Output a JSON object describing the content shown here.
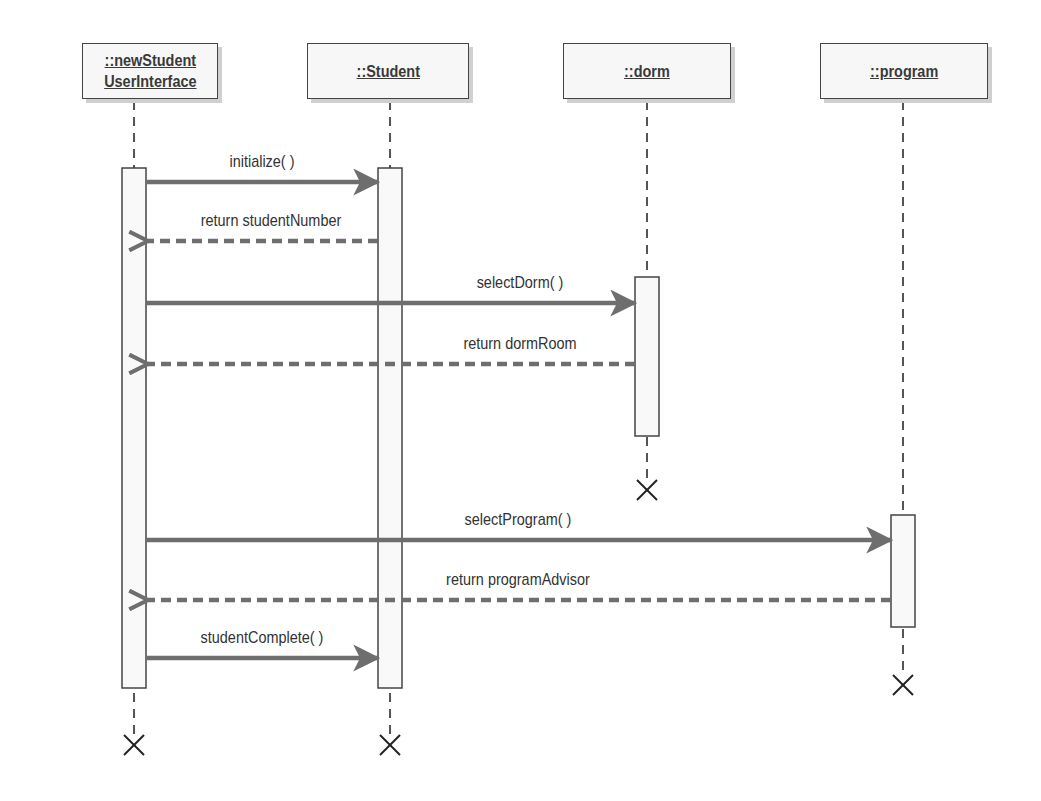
{
  "diagram_type": "UML sequence diagram",
  "colors": {
    "box_fill": "#f7f7f7",
    "box_border": "#444444",
    "box_shadow": "#d0d0d0",
    "lifeline": "#555555",
    "message_arrow": "#6e6e6e",
    "activation_fill": "#f9f9f9"
  },
  "objects": [
    {
      "id": "ui",
      "label": "::newStudent\nUserInterface",
      "x": 134,
      "box": [
        82,
        43,
        136,
        56
      ]
    },
    {
      "id": "student",
      "label": "::Student",
      "x": 390,
      "box": [
        307,
        43,
        162,
        56
      ]
    },
    {
      "id": "dorm",
      "label": "::dorm",
      "x": 647,
      "box": [
        563,
        43,
        168,
        56
      ]
    },
    {
      "id": "program",
      "label": "::program",
      "x": 903,
      "box": [
        820,
        43,
        168,
        56
      ]
    }
  ],
  "activations": [
    {
      "object": "ui",
      "y_start": 168,
      "y_end": 688
    },
    {
      "object": "student",
      "y_start": 168,
      "y_end": 688
    },
    {
      "object": "dorm",
      "y_start": 277,
      "y_end": 436
    },
    {
      "object": "program",
      "y_start": 515,
      "y_end": 627
    }
  ],
  "messages": [
    {
      "label": "initialize( )",
      "from": "ui",
      "to": "student",
      "y": 182,
      "type": "sync"
    },
    {
      "label": "return studentNumber",
      "from": "student",
      "to": "ui",
      "y": 241,
      "type": "return"
    },
    {
      "label": "selectDorm( )",
      "from": "ui",
      "to": "dorm",
      "y": 303,
      "type": "sync"
    },
    {
      "label": "return dormRoom",
      "from": "dorm",
      "to": "ui",
      "y": 364,
      "type": "return"
    },
    {
      "label": "selectProgram( )",
      "from": "ui",
      "to": "program",
      "y": 540,
      "type": "sync"
    },
    {
      "label": "return programAdvisor",
      "from": "program",
      "to": "ui",
      "y": 600,
      "type": "return"
    },
    {
      "label": "studentComplete( )",
      "from": "ui",
      "to": "student",
      "y": 658,
      "type": "sync"
    }
  ],
  "destructions": [
    {
      "object": "ui",
      "y": 745
    },
    {
      "object": "student",
      "y": 745
    },
    {
      "object": "dorm",
      "y": 490
    },
    {
      "object": "program",
      "y": 685
    }
  ]
}
